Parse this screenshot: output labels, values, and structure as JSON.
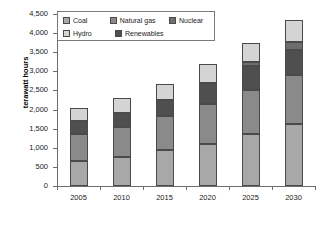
{
  "chart_data": {
    "type": "bar",
    "title": "",
    "subtitle": "",
    "xlabel": "",
    "ylabel": "terawatt hours",
    "categories": [
      "2005",
      "2010",
      "2015",
      "2020",
      "2025",
      "2030"
    ],
    "ylim": [
      0,
      4500
    ],
    "ytick_step": 500,
    "ytick_labels": [
      "0",
      "500",
      "1,000",
      "1,500",
      "2,000",
      "2,500",
      "3,000",
      "3,500",
      "4,000",
      "4,500"
    ],
    "ytick_values": [
      0,
      500,
      1000,
      1500,
      2000,
      2500,
      3000,
      3500,
      4000,
      4500
    ],
    "stacked": true,
    "grid": false,
    "legend_position": "top-left-inside",
    "series": [
      {
        "name": "Coal",
        "color": "#a8a8a8",
        "values": [
          650,
          760,
          940,
          1100,
          1370,
          1620
        ]
      },
      {
        "name": "Natural gas",
        "color": "#8a8a8a",
        "values": [
          720,
          780,
          880,
          1050,
          1150,
          1280
        ]
      },
      {
        "name": "Renewables",
        "color": "#4f4f4f",
        "values": [
          330,
          380,
          440,
          540,
          620,
          650
        ]
      },
      {
        "name": "Nuclear",
        "color": "#6e6e6e",
        "values": [
          0,
          0,
          0,
          0,
          100,
          230
        ]
      },
      {
        "name": "Hydro",
        "color": "#d4d4d4",
        "values": [
          350,
          370,
          420,
          490,
          510,
          570
        ]
      }
    ],
    "totals": [
      2050,
      2290,
      2680,
      3180,
      3750,
      4350
    ],
    "segment_order_bottom_to_top": [
      "Coal",
      "Natural gas",
      "Renewables",
      "Nuclear",
      "Hydro"
    ]
  },
  "legend": {
    "items": [
      {
        "label": "Coal",
        "color": "#a8a8a8"
      },
      {
        "label": "Natural gas",
        "color": "#8a8a8a"
      },
      {
        "label": "Nuclear",
        "color": "#6e6e6e"
      },
      {
        "label": "Hydro",
        "color": "#d4d4d4"
      },
      {
        "label": "Renewables",
        "color": "#4f4f4f"
      }
    ]
  },
  "axes": {
    "y_title": "terawatt hours",
    "axis_color": "#6d6d6d",
    "tick_label_color": "#1a1a1a"
  }
}
